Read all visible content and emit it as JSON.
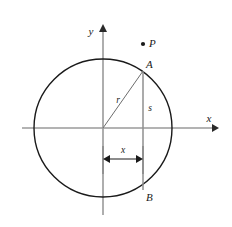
{
  "figure": {
    "type": "geometry-diagram",
    "background_color": "#ffffff"
  },
  "axes": {
    "x_label": "x",
    "y_label": "y",
    "color": "#9a9a9a",
    "origin": {
      "x": 103,
      "y": 128
    },
    "x_axis": {
      "start_x": 22,
      "end_x": 216,
      "y": 128,
      "arrow": "right"
    },
    "y_axis": {
      "x": 103,
      "start_y": 215,
      "end_y": 26,
      "arrow": "up"
    }
  },
  "circle": {
    "center_x": 103,
    "center_y": 128,
    "radius": 69,
    "stroke_color": "#1a1a1a",
    "stroke_width": 1.3,
    "fill": "none"
  },
  "points": [
    {
      "name": "P",
      "label": "P",
      "cx": 143,
      "cy": 44,
      "dot": true,
      "dot_radius": 2.1,
      "label_dx": 5,
      "label_dy": 2
    },
    {
      "name": "A",
      "label": "A",
      "cx": 143,
      "cy": 71,
      "dot": false,
      "label_dx": 3,
      "label_dy": -4
    },
    {
      "name": "B",
      "label": "B",
      "cx": 143,
      "cy": 190,
      "dot": false,
      "label_dx": 3,
      "label_dy": 11
    }
  ],
  "segments": {
    "radius": {
      "label": "r",
      "from_x": 103,
      "from_y": 128,
      "to_x": 143,
      "to_y": 71,
      "color": "#6d6d6d",
      "label_x": 119,
      "label_y": 100
    },
    "chord": {
      "label": "s",
      "x": 143,
      "top_y": 71,
      "bottom_y": 190,
      "color": "#8a8a8a",
      "label_x": 148,
      "label_y": 108
    }
  },
  "dimension": {
    "label": "x",
    "y": 159,
    "from_x": 103,
    "to_x": 143,
    "color": "#1a1a1a",
    "label_x": 123,
    "label_y": 152,
    "tick_top": 143,
    "tick_bottom": 175
  }
}
